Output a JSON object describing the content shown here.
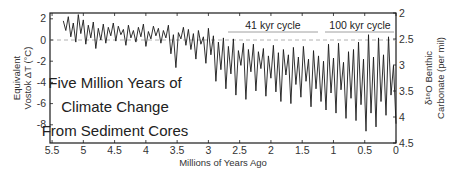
{
  "chart_data": {
    "type": "line",
    "title": "Five Million Years of Climate Change From Sediment Cores",
    "title_lines": [
      "Five Million Years of",
      "Climate Change",
      "From Sediment Cores"
    ],
    "xlabel": "Millions of Years Ago",
    "ylabel_left_lines": [
      "Equivalent",
      "Vostok ΔT (°C)"
    ],
    "ylabel_right_lines": [
      "δ¹⁸O Benthic",
      "Carbonate (per mil)"
    ],
    "x_ticks": [
      "5.5",
      "5",
      "4.5",
      "4",
      "3.5",
      "3",
      "2.5",
      "2",
      "1.5",
      "1",
      "0.5",
      "0"
    ],
    "y_left_ticks": [
      "2",
      "0",
      "-2",
      "-4",
      "-6",
      "-8"
    ],
    "y_right_ticks": [
      "2",
      "2.5",
      "3",
      "3.5",
      "4",
      "4.5"
    ],
    "xlim": [
      5.5,
      0
    ],
    "ylim_left": [
      2.6,
      -9.7
    ],
    "ylim_right": [
      2,
      4.5
    ],
    "x_reversed": true,
    "grid": false,
    "reference_line": {
      "y_left": 0,
      "style": "dashed",
      "color": "#9a9a9a"
    },
    "annotations": [
      {
        "text": "41 kyr cycle",
        "x_start": 2.7,
        "x_end": 1.25
      },
      {
        "text": "100 kyr cycle",
        "x_start": 1.15,
        "x_end": 0.0
      }
    ],
    "series": [
      {
        "name": "Equivalent Vostok ΔT / δ18O benthic carbonate",
        "color": "#1a1a1a",
        "x": [
          5.32,
          5.28,
          5.24,
          5.2,
          5.16,
          5.12,
          5.08,
          5.04,
          5.0,
          4.96,
          4.92,
          4.88,
          4.84,
          4.8,
          4.76,
          4.72,
          4.68,
          4.64,
          4.6,
          4.56,
          4.52,
          4.48,
          4.44,
          4.4,
          4.36,
          4.32,
          4.28,
          4.24,
          4.2,
          4.16,
          4.12,
          4.08,
          4.04,
          4.0,
          3.96,
          3.92,
          3.88,
          3.84,
          3.8,
          3.76,
          3.72,
          3.68,
          3.64,
          3.6,
          3.56,
          3.52,
          3.48,
          3.44,
          3.4,
          3.36,
          3.32,
          3.28,
          3.24,
          3.2,
          3.16,
          3.12,
          3.08,
          3.04,
          3.0,
          2.96,
          2.92,
          2.88,
          2.84,
          2.8,
          2.76,
          2.72,
          2.68,
          2.64,
          2.6,
          2.56,
          2.52,
          2.48,
          2.44,
          2.4,
          2.36,
          2.32,
          2.28,
          2.24,
          2.2,
          2.16,
          2.12,
          2.08,
          2.04,
          2.0,
          1.96,
          1.92,
          1.88,
          1.84,
          1.8,
          1.76,
          1.72,
          1.68,
          1.64,
          1.6,
          1.56,
          1.52,
          1.48,
          1.44,
          1.4,
          1.36,
          1.32,
          1.28,
          1.24,
          1.2,
          1.16,
          1.12,
          1.08,
          1.04,
          1.0,
          0.96,
          0.92,
          0.88,
          0.84,
          0.8,
          0.76,
          0.72,
          0.68,
          0.64,
          0.6,
          0.56,
          0.52,
          0.48,
          0.44,
          0.4,
          0.36,
          0.32,
          0.28,
          0.24,
          0.2,
          0.16,
          0.12,
          0.08,
          0.04,
          0.0
        ],
        "values_left_deltaT": [
          1.8,
          0.9,
          2.2,
          0.3,
          1.6,
          -0.2,
          2.4,
          0.6,
          1.9,
          -0.4,
          1.4,
          0.2,
          1.7,
          -0.8,
          1.1,
          0.0,
          1.5,
          -0.3,
          1.2,
          0.4,
          1.6,
          -0.1,
          1.3,
          0.5,
          1.0,
          -0.5,
          1.4,
          0.2,
          0.9,
          -0.2,
          1.2,
          0.3,
          1.5,
          -0.6,
          0.8,
          0.1,
          1.3,
          0.4,
          1.1,
          -0.3,
          0.9,
          0.2,
          1.4,
          -1.3,
          0.5,
          -2.6,
          0.7,
          0.1,
          1.2,
          -0.5,
          1.0,
          -0.9,
          0.6,
          -1.8,
          0.9,
          -0.4,
          0.3,
          -2.2,
          1.1,
          -1.4,
          0.4,
          -3.9,
          -0.2,
          -2.8,
          0.2,
          -4.6,
          -0.6,
          -3.2,
          0.1,
          -5.2,
          -1.0,
          -2.4,
          -0.3,
          -5.6,
          -0.9,
          -3.0,
          -0.4,
          -4.8,
          -1.1,
          -2.7,
          -0.8,
          -5.3,
          -1.5,
          -3.6,
          -0.5,
          -4.9,
          -1.2,
          -5.8,
          -0.9,
          -3.3,
          -1.4,
          -6.0,
          -0.7,
          -4.2,
          -1.6,
          -5.4,
          -0.6,
          -3.9,
          -1.8,
          -6.3,
          -1.0,
          -4.6,
          -1.5,
          -5.8,
          -2.0,
          -6.6,
          -0.4,
          -5.0,
          -1.7,
          -6.9,
          -0.3,
          -4.7,
          -2.1,
          -7.4,
          -1.1,
          -5.5,
          -0.9,
          -7.6,
          -0.2,
          -6.1,
          -1.8,
          -8.6,
          0.5,
          -6.9,
          -1.6,
          -8.2,
          0.2,
          -5.8,
          -1.4,
          -7.1,
          0.3,
          -5.2,
          -2.4,
          -7.9,
          -0.8,
          -8.4
        ]
      }
    ]
  }
}
